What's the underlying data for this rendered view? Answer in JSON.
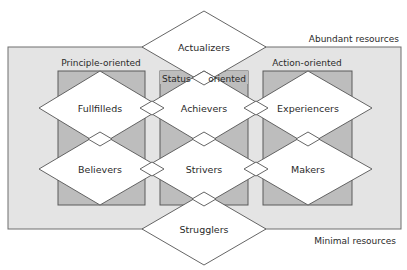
{
  "diagram": {
    "resources": {
      "top_label": "Abundant resources",
      "bottom_label": "Minimal resources"
    },
    "orientations": [
      {
        "id": "principle",
        "label": "Principle-oriented"
      },
      {
        "id": "status",
        "label_left": "Status",
        "label_right": "oriented"
      },
      {
        "id": "action",
        "label": "Action-oriented"
      }
    ],
    "segments": {
      "top": "Actualizers",
      "row1": [
        "Fullfilleds",
        "Achievers",
        "Experiencers"
      ],
      "row2": [
        "Believers",
        "Strivers",
        "Makers"
      ],
      "bottom": "Strugglers"
    },
    "colors": {
      "outer_fill": "#e4e4e4",
      "box_fill": "#bdbdbd",
      "diamond_fill": "#ffffff",
      "stroke": "#555555"
    }
  }
}
